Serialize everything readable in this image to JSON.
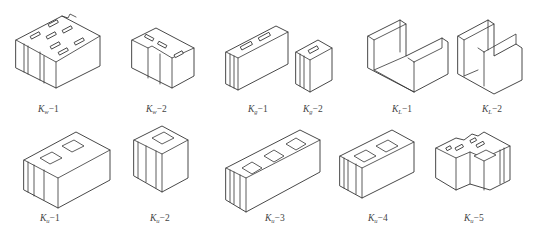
{
  "figure": {
    "line_color": "#333333",
    "background": "#ffffff",
    "blocks": [
      {
        "id": "kw-1",
        "base": "K",
        "sub": "w",
        "suffix": "−1"
      },
      {
        "id": "kw-2",
        "base": "K",
        "sub": "w",
        "suffix": "−2"
      },
      {
        "id": "kg-1",
        "base": "K",
        "sub": "g",
        "suffix": "−1"
      },
      {
        "id": "kg-2",
        "base": "K",
        "sub": "g",
        "suffix": "−2"
      },
      {
        "id": "kl-1",
        "base": "K",
        "sub": "L",
        "suffix": "−1"
      },
      {
        "id": "kl-2",
        "base": "K",
        "sub": "L",
        "suffix": "−2"
      },
      {
        "id": "ku-1",
        "base": "K",
        "sub": "u",
        "suffix": "−1"
      },
      {
        "id": "ku-2",
        "base": "K",
        "sub": "u",
        "suffix": "−2"
      },
      {
        "id": "ku-3",
        "base": "K",
        "sub": "u",
        "suffix": "−3"
      },
      {
        "id": "ku-4",
        "base": "K",
        "sub": "u",
        "suffix": "−4"
      },
      {
        "id": "ku-5",
        "base": "K",
        "sub": "u",
        "suffix": "−5"
      }
    ]
  }
}
